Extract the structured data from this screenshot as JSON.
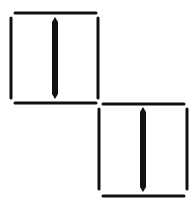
{
  "diagram": {
    "cells": [
      {
        "id": "cell-1",
        "x": 10,
        "y": 12,
        "w": 90,
        "h": 91,
        "bar": "vertical"
      },
      {
        "id": "cell-2",
        "x": 98,
        "y": 103,
        "w": 90,
        "h": 91,
        "bar": "vertical"
      }
    ],
    "colors": {
      "stroke": "#111111",
      "background": "#ffffff"
    }
  }
}
